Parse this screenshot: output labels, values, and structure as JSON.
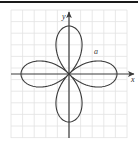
{
  "figure": {
    "background_color": "#ffffff",
    "width": 138,
    "height": 145,
    "top_rule_color": "#1a1a1a"
  },
  "grid": {
    "visible": true,
    "color": "#e2e2e2",
    "spacing_px": 11.6,
    "columns": 10,
    "rows": 11,
    "left": 11,
    "top": 10,
    "right": 127,
    "bottom": 138
  },
  "axes": {
    "color": "#3b3b3b",
    "origin_x": 69,
    "origin_y": 74,
    "x_axis": {
      "label": "x",
      "label_x": 131,
      "label_y": 82,
      "arrow_at": "right",
      "start_x": 11,
      "end_x": 134
    },
    "y_axis": {
      "label": "y",
      "label_x": 62,
      "label_y": 19,
      "arrow_at": "top",
      "start_y": 138,
      "end_y": 12
    }
  },
  "annotations": [
    {
      "name": "amplitude-label",
      "text": "a",
      "x": 94,
      "y": 54
    }
  ],
  "chart_data": {
    "type": "line",
    "title": "",
    "subtitle": "",
    "xlabel": "x",
    "ylabel": "y",
    "curve_name": "four-petaled rose",
    "polar_equation": "r = a sin(2θ)",
    "petal_count": 4,
    "petal_amplitude_px": 48,
    "petal_orientation_deg": [
      90,
      0,
      270,
      180
    ],
    "grid": true,
    "legend": "none",
    "stroke_color": "#3a3a3a",
    "stroke_width": 1.1,
    "xlim": [
      -5,
      5
    ],
    "ylim": [
      -5.5,
      5.5
    ],
    "series": [
      {
        "name": "rose-curve",
        "description": "Four congruent petals meeting at the origin, aligned with the positive y, positive x, negative y and negative x directions.",
        "petals": [
          {
            "direction": "up",
            "tip_x": 0,
            "tip_y": 4.1,
            "half_width": 1.1
          },
          {
            "direction": "right",
            "tip_x": 4.1,
            "tip_y": 0,
            "half_width": 1.1
          },
          {
            "direction": "down",
            "tip_x": 0,
            "tip_y": -4.1,
            "half_width": 1.1
          },
          {
            "direction": "left",
            "tip_x": -4.1,
            "tip_y": 0,
            "half_width": 1.1
          }
        ]
      }
    ]
  }
}
